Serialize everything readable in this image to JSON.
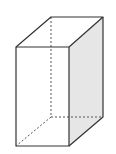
{
  "diagram": {
    "type": "rectangular-prism",
    "colors": {
      "stroke": "#333333",
      "hidden_stroke": "#555555",
      "shaded_face": "#e6e6e6",
      "background": "#ffffff"
    },
    "vertices": {
      "front_top_left": [
        16,
        47
      ],
      "front_top_right": [
        69,
        47
      ],
      "front_bottom_left": [
        16,
        146
      ],
      "front_bottom_right": [
        69,
        146
      ],
      "back_top_left": [
        51,
        17
      ],
      "back_top_right": [
        103,
        17
      ],
      "back_bottom_left": [
        51,
        117
      ],
      "back_bottom_right": [
        103,
        117
      ]
    },
    "shaded_face": "right",
    "hidden_edges": [
      "back_top_left-back_bottom_left",
      "back_bottom_left-back_bottom_right",
      "back_bottom_left-front_bottom_left"
    ]
  }
}
